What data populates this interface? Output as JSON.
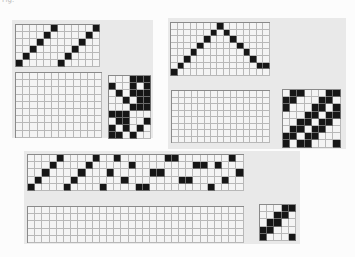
{
  "caption": "Fig.",
  "colors": {
    "panel_bg": "#e9e9e9",
    "grid_bg": "#f4f4f4",
    "filled": "#161616",
    "grid_line": "#b8b8b8"
  },
  "drafts": [
    {
      "id": "draft-1",
      "panel": {
        "x": 12,
        "y": 20,
        "w": 141,
        "h": 118
      },
      "threading": {
        "x": 15,
        "y": 24,
        "cols": 12,
        "rows": 6,
        "cell": 7,
        "marks": [
          [
            0,
            5
          ],
          [
            1,
            4
          ],
          [
            2,
            3
          ],
          [
            3,
            2
          ],
          [
            4,
            1
          ],
          [
            5,
            0
          ],
          [
            6,
            5
          ],
          [
            7,
            4
          ],
          [
            8,
            3
          ],
          [
            9,
            2
          ],
          [
            10,
            1
          ],
          [
            11,
            0
          ]
        ]
      },
      "drawdown": {
        "x": 15,
        "y": 72,
        "cols": 12,
        "rows": 9,
        "cell": 7.2,
        "marks": []
      },
      "tieup": {
        "x": 108,
        "y": 75,
        "cols": 6,
        "rows": 9,
        "cell": 7,
        "matrix": [
          [
            0,
            0,
            0,
            1,
            1,
            1
          ],
          [
            1,
            0,
            0,
            1,
            0,
            1
          ],
          [
            0,
            1,
            0,
            1,
            1,
            1
          ],
          [
            0,
            0,
            1,
            0,
            1,
            1
          ],
          [
            0,
            0,
            0,
            1,
            1,
            1
          ],
          [
            1,
            1,
            1,
            0,
            0,
            0
          ],
          [
            0,
            1,
            1,
            0,
            0,
            1
          ],
          [
            1,
            0,
            1,
            0,
            1,
            0
          ],
          [
            1,
            1,
            0,
            1,
            0,
            0
          ]
        ]
      }
    },
    {
      "id": "draft-2",
      "panel": {
        "x": 168,
        "y": 18,
        "w": 178,
        "h": 131
      },
      "threading": {
        "x": 170,
        "y": 22,
        "cols": 15,
        "rows": 8,
        "cell": 6.6,
        "marks": [
          [
            0,
            7
          ],
          [
            1,
            6
          ],
          [
            2,
            5
          ],
          [
            3,
            4
          ],
          [
            4,
            3
          ],
          [
            5,
            2
          ],
          [
            6,
            1
          ],
          [
            7,
            0
          ],
          [
            8,
            1
          ],
          [
            9,
            2
          ],
          [
            10,
            3
          ],
          [
            11,
            4
          ],
          [
            12,
            5
          ],
          [
            13,
            6
          ],
          [
            14,
            6
          ]
        ]
      },
      "drawdown": {
        "x": 171,
        "y": 90,
        "cols": 15,
        "rows": 8,
        "cell": 6.5,
        "marks": []
      },
      "tieup": {
        "x": 282,
        "y": 89,
        "cols": 8,
        "rows": 8,
        "cell": 7.2,
        "matrix": [
          [
            0,
            1,
            1,
            0,
            0,
            0,
            1,
            1
          ],
          [
            1,
            1,
            0,
            0,
            0,
            1,
            1,
            0
          ],
          [
            1,
            0,
            0,
            0,
            1,
            1,
            0,
            1
          ],
          [
            0,
            0,
            0,
            1,
            1,
            0,
            1,
            1
          ],
          [
            0,
            0,
            1,
            1,
            0,
            1,
            1,
            0
          ],
          [
            0,
            1,
            1,
            0,
            1,
            1,
            0,
            0
          ],
          [
            1,
            1,
            0,
            1,
            1,
            0,
            0,
            0
          ],
          [
            1,
            0,
            1,
            1,
            0,
            0,
            0,
            1
          ]
        ]
      }
    },
    {
      "id": "draft-3",
      "panel": {
        "x": 24,
        "y": 151,
        "w": 276,
        "h": 93
      },
      "threading": {
        "x": 27,
        "y": 154,
        "cols": 30,
        "rows": 5,
        "cell": 7.2,
        "marks": [
          [
            0,
            4
          ],
          [
            1,
            3
          ],
          [
            2,
            2
          ],
          [
            3,
            1
          ],
          [
            4,
            0
          ],
          [
            5,
            4
          ],
          [
            6,
            3
          ],
          [
            7,
            2
          ],
          [
            8,
            1
          ],
          [
            9,
            0
          ],
          [
            10,
            4
          ],
          [
            11,
            2
          ],
          [
            12,
            0
          ],
          [
            13,
            3
          ],
          [
            14,
            1
          ],
          [
            15,
            4
          ],
          [
            16,
            4
          ],
          [
            17,
            2
          ],
          [
            18,
            2
          ],
          [
            19,
            0
          ],
          [
            20,
            0
          ],
          [
            21,
            3
          ],
          [
            22,
            3
          ],
          [
            23,
            1
          ],
          [
            24,
            1
          ],
          [
            25,
            4
          ],
          [
            26,
            1
          ],
          [
            27,
            3
          ],
          [
            28,
            0
          ],
          [
            29,
            2
          ]
        ]
      },
      "drawdown": {
        "x": 27,
        "y": 206,
        "cols": 30,
        "rows": 5,
        "cell": 7.2,
        "marks": []
      },
      "tieup": {
        "x": 259,
        "y": 204,
        "cols": 5,
        "rows": 5,
        "cell": 7.2,
        "matrix": [
          [
            0,
            0,
            0,
            1,
            1
          ],
          [
            0,
            0,
            1,
            1,
            0
          ],
          [
            0,
            1,
            1,
            0,
            0
          ],
          [
            1,
            1,
            0,
            0,
            0
          ],
          [
            1,
            0,
            0,
            0,
            1
          ]
        ]
      }
    }
  ]
}
